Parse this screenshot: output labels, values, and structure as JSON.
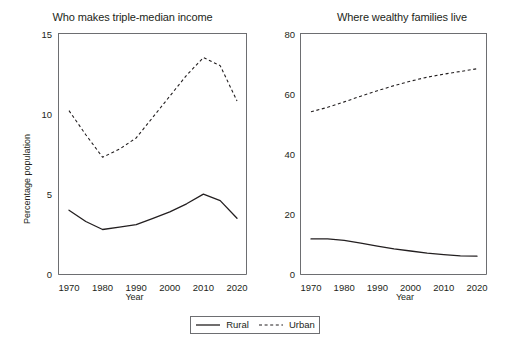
{
  "figure": {
    "background": "#ffffff",
    "line_color": "#231f20",
    "axis_color": "#6d6e71"
  },
  "legend": {
    "entries": [
      {
        "label": "Rural",
        "style": "solid",
        "icon": "solid-line-icon"
      },
      {
        "label": "Urban",
        "style": "dashed",
        "icon": "dashed-line-icon"
      }
    ]
  },
  "panels": [
    {
      "id": "left",
      "title": "Who makes triple-median income",
      "xlabel": "Year",
      "ylabel": "Percentage population",
      "yticks": [
        "0",
        "5",
        "10",
        "15"
      ],
      "xticks": [
        "1970",
        "1980",
        "1990",
        "2000",
        "2010",
        "2020"
      ]
    },
    {
      "id": "right",
      "title": "Where wealthy families live",
      "xlabel": "Year",
      "ylabel": "Percentage of wealthy families",
      "yticks": [
        "0",
        "20",
        "40",
        "60",
        "80"
      ],
      "xticks": [
        "1970",
        "1980",
        "1990",
        "2000",
        "2010",
        "2020"
      ]
    }
  ],
  "chart_data": [
    {
      "type": "line",
      "title": "Who makes triple-median income",
      "xlabel": "Year",
      "ylabel": "Percentage population",
      "xlim": [
        1968,
        2022
      ],
      "ylim": [
        0,
        15
      ],
      "yticks": [
        0,
        5,
        10,
        15
      ],
      "xticks": [
        1970,
        1980,
        1990,
        2000,
        2010,
        2020
      ],
      "grid": false,
      "legend_position": "bottom-center-shared",
      "x": [
        1970,
        1975,
        1980,
        1985,
        1990,
        1995,
        2000,
        2005,
        2010,
        2015,
        2020
      ],
      "series": [
        {
          "name": "Rural",
          "style": "solid",
          "values": [
            4.0,
            3.3,
            2.8,
            2.95,
            3.1,
            3.5,
            3.9,
            4.4,
            5.0,
            4.6,
            3.5
          ]
        },
        {
          "name": "Urban",
          "style": "dashed",
          "values": [
            10.2,
            8.7,
            7.3,
            7.8,
            8.5,
            9.8,
            11.1,
            12.4,
            13.5,
            13.0,
            10.8
          ]
        }
      ]
    },
    {
      "type": "line",
      "title": "Where wealthy families live",
      "xlabel": "Year",
      "ylabel": "Percentage of wealthy families",
      "xlim": [
        1968,
        2022
      ],
      "ylim": [
        0,
        80
      ],
      "yticks": [
        0,
        20,
        40,
        60,
        80
      ],
      "xticks": [
        1970,
        1980,
        1990,
        2000,
        2010,
        2020
      ],
      "grid": false,
      "legend_position": "bottom-center-shared",
      "x": [
        1970,
        1975,
        1980,
        1985,
        1990,
        1995,
        2000,
        2005,
        2010,
        2015,
        2020
      ],
      "series": [
        {
          "name": "Rural",
          "style": "solid",
          "values": [
            11.8,
            11.8,
            11.3,
            10.4,
            9.4,
            8.5,
            7.8,
            7.1,
            6.6,
            6.2,
            6.1
          ]
        },
        {
          "name": "Urban",
          "style": "dashed",
          "values": [
            54.0,
            55.5,
            57.3,
            59.2,
            61.0,
            62.7,
            64.2,
            65.5,
            66.5,
            67.4,
            68.3
          ]
        }
      ]
    }
  ]
}
